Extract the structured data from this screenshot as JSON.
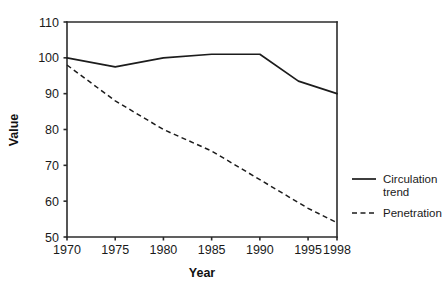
{
  "chart_data": {
    "type": "line",
    "title": "",
    "xlabel": "Year",
    "ylabel": "Value",
    "xlim": [
      1970,
      1998
    ],
    "ylim": [
      50,
      110
    ],
    "grid": false,
    "legend_position": "right",
    "x_ticks": [
      1970,
      1975,
      1980,
      1985,
      1990,
      1995,
      1998
    ],
    "x_tick_labels": [
      "1970",
      "1975",
      "1980",
      "1985",
      "1990",
      "1995",
      "1998"
    ],
    "y_ticks": [
      50,
      60,
      70,
      80,
      90,
      100,
      110
    ],
    "y_tick_labels": [
      "50",
      "60",
      "70",
      "80",
      "90",
      "100",
      "110"
    ],
    "series": [
      {
        "name": "Circulation trend",
        "style": "solid",
        "color": "#1c1c1c",
        "x": [
          1970,
          1975,
          1980,
          1985,
          1989,
          1990,
          1994,
          1998
        ],
        "values": [
          100.0,
          97.5,
          100.0,
          101.0,
          101.0,
          101.0,
          93.5,
          90.0
        ]
      },
      {
        "name": "Penetration",
        "style": "dashed",
        "color": "#1c1c1c",
        "x": [
          1970,
          1975,
          1980,
          1985,
          1990,
          1995,
          1998
        ],
        "values": [
          98.0,
          88.0,
          80.0,
          74.0,
          66.0,
          58.0,
          54.0
        ]
      }
    ]
  },
  "legend": {
    "entries": [
      {
        "label_line1": "Circulation",
        "label_line2": "trend",
        "style": "solid"
      },
      {
        "label_line1": "Penetration",
        "label_line2": "",
        "style": "dashed"
      }
    ]
  }
}
